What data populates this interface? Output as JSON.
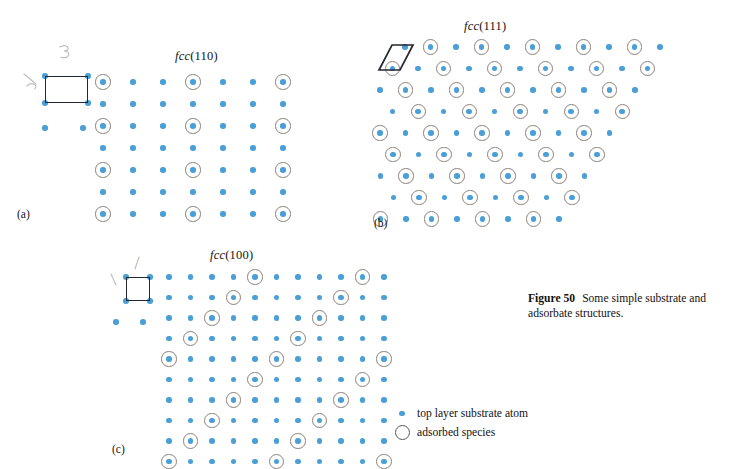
{
  "figure": {
    "caption_label": "Figure 50",
    "caption_text": "Some simple substrate and adsorbate structures."
  },
  "panels": [
    {
      "id": "a",
      "label": "(a)",
      "title_italic": "fcc",
      "title_roman": "(110)",
      "lattice_type": "rectangular",
      "cols": 7,
      "rows": 7,
      "dx": 30,
      "dy": 22,
      "origin_x": 103,
      "origin_y": 82,
      "adsorbate_rows": [
        0,
        2,
        4,
        6
      ],
      "adsorbate_cols": [
        0,
        3,
        6
      ],
      "unit_cell": {
        "shape": "rectangle",
        "x": 45,
        "y": 76,
        "width": 43,
        "height": 27
      },
      "cell_corner_atoms": [
        {
          "x": 45,
          "y": 76
        },
        {
          "x": 88,
          "y": 76
        },
        {
          "x": 45,
          "y": 103
        },
        {
          "x": 88,
          "y": 103
        }
      ],
      "stray_atoms": [
        {
          "x": 45,
          "y": 128
        },
        {
          "x": 83,
          "y": 128
        }
      ],
      "annotations": [
        {
          "kind": "pencil-3",
          "x": 62,
          "y": 54
        },
        {
          "kind": "pencil-tick",
          "x": 26,
          "y": 82
        }
      ]
    },
    {
      "id": "b",
      "label": "(b)",
      "title_italic": "fcc",
      "title_roman": "(111)",
      "lattice_type": "hexagonal",
      "cols": 11,
      "rows": 9,
      "dx": 25.5,
      "dy": 21.5,
      "row_shift": -12.6,
      "origin_x": 405,
      "origin_y": 47,
      "adsorbate_parity": 1,
      "unit_cell": {
        "shape": "rhombus",
        "x": 379,
        "y": 45,
        "width": 34,
        "height": 25,
        "skew": 13
      }
    },
    {
      "id": "c",
      "label": "(c)",
      "title_italic": "fcc",
      "title_roman": "(100)",
      "lattice_type": "square",
      "cols": 11,
      "rows": 10,
      "dx": 21.5,
      "dy": 20.5,
      "origin_x": 169,
      "origin_y": 277,
      "adsorbate_start_col": 4,
      "adsorbate_period": 5,
      "adsorbate_row_shift": -1,
      "unit_cell": {
        "shape": "square",
        "x": 126,
        "y": 277,
        "width": 24,
        "height": 24
      },
      "cell_corner_atoms": [
        {
          "x": 126,
          "y": 277
        },
        {
          "x": 150,
          "y": 277
        },
        {
          "x": 126,
          "y": 301
        },
        {
          "x": 150,
          "y": 301
        }
      ],
      "stray_atoms": [
        {
          "x": 116,
          "y": 322
        },
        {
          "x": 143,
          "y": 322
        }
      ],
      "annotations": [
        {
          "kind": "pencil-tick-up",
          "x": 137,
          "y": 263
        },
        {
          "kind": "pencil-tick-left",
          "x": 116,
          "y": 278
        }
      ]
    }
  ],
  "legend": {
    "items": [
      {
        "key": "substrate-atom",
        "label": "top layer substrate atom"
      },
      {
        "key": "adsorbed-species",
        "label": "adsorbed species"
      }
    ]
  },
  "colors": {
    "substrate_atom": "#4a9fd6",
    "adsorbate_ring": "#8d8278",
    "unit_cell_line": "#232733",
    "pencil": "#b3ada6",
    "text": "#121212",
    "background": "#ffffff"
  }
}
